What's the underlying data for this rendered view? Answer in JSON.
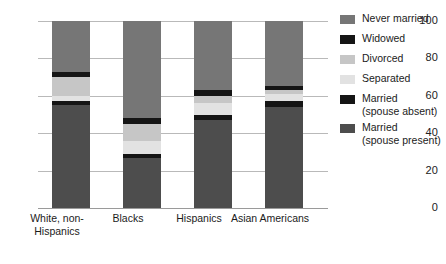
{
  "chart_data": {
    "type": "bar",
    "subtype": "stacked-bar-100",
    "title": "",
    "xlabel": "",
    "ylabel": "",
    "ylim": [
      0,
      100
    ],
    "yticks": [
      0,
      20,
      40,
      60,
      80,
      100
    ],
    "ytick_labels": [
      "0",
      "20",
      "40",
      "60",
      "80",
      "100"
    ],
    "grid": true,
    "legend_position": "right",
    "categories": [
      "White, non-\nHispanics",
      "Blacks",
      "Hispanics",
      "Asian\nAmericans"
    ],
    "series": [
      {
        "name": "Married\n(spouse present)",
        "color": "#4d4d4d",
        "values": [
          55,
          27,
          47,
          54
        ]
      },
      {
        "name": "Married\n(spouse absent)",
        "color": "#151515",
        "values": [
          2,
          2,
          3,
          3
        ]
      },
      {
        "name": "Separated",
        "color": "#e2e2e2",
        "values": [
          3,
          7,
          6,
          4
        ]
      },
      {
        "name": "Divorced",
        "color": "#c6c6c6",
        "values": [
          10,
          9,
          4,
          2
        ]
      },
      {
        "name": "Widowed",
        "color": "#151515",
        "values": [
          3,
          3,
          3,
          2
        ]
      },
      {
        "name": "Never married",
        "color": "#767676",
        "values": [
          27,
          52,
          37,
          35
        ]
      }
    ]
  },
  "legend": {
    "entries": [
      {
        "label": "Never married",
        "color": "#767676"
      },
      {
        "label": "Widowed",
        "color": "#151515"
      },
      {
        "label": "Divorced",
        "color": "#c6c6c6"
      },
      {
        "label": "Separated",
        "color": "#e2e2e2"
      },
      {
        "label": "Married\n(spouse absent)",
        "color": "#151515"
      },
      {
        "label": "Married\n(spouse present)",
        "color": "#4d4d4d"
      }
    ]
  },
  "axis": {
    "ytick_0": "0",
    "ytick_20": "20",
    "ytick_40": "40",
    "ytick_60": "60",
    "ytick_80": "80",
    "ytick_100": "100"
  },
  "xlabels": {
    "cat0": "White, non-\nHispanics",
    "cat1": "Blacks",
    "cat2": "Hispanics",
    "cat3": "Asian\nAmericans"
  }
}
